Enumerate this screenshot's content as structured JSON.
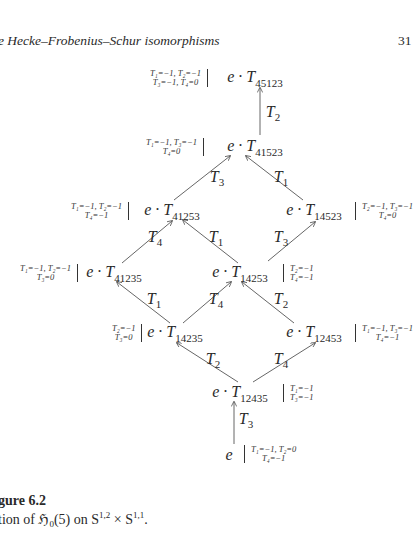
{
  "header": {
    "running_head": "e Hecke–Frobenius–Schur isomorphisms",
    "page_number": "31"
  },
  "diagram": {
    "nodes": [
      {
        "id": "T45123",
        "prefix": "e · ",
        "op": "T",
        "sub": "45123",
        "ann_side": "left",
        "ann_line1": "T₁=−1, T₂=−1",
        "ann_line2": "T₃=−1, T₄=0"
      },
      {
        "id": "T41523",
        "prefix": "e · ",
        "op": "T",
        "sub": "41523",
        "ann_side": "left",
        "ann_line1": "T₁=−1, T₃=−1",
        "ann_line2": "T₄=0"
      },
      {
        "id": "T41253",
        "prefix": "e · ",
        "op": "T",
        "sub": "41253",
        "ann_side": "left",
        "ann_line1": "T₁=−1, T₂=−1",
        "ann_line2": "T₄=−1"
      },
      {
        "id": "T14523",
        "prefix": "e · ",
        "op": "T",
        "sub": "14523",
        "ann_side": "right",
        "ann_line1": "T₂=−1, T₃=−1",
        "ann_line2": "T₄=0"
      },
      {
        "id": "T41235",
        "prefix": "e · ",
        "op": "T",
        "sub": "41235",
        "ann_side": "left",
        "ann_line1": "T₁=−1, T₂=−1",
        "ann_line2": "T₃=0"
      },
      {
        "id": "T14253",
        "prefix": "e · ",
        "op": "T",
        "sub": "14253",
        "ann_side": "right",
        "ann_line1": "T₂=−1",
        "ann_line2": "T₄=−1"
      },
      {
        "id": "T14235",
        "prefix": "e · ",
        "op": "T",
        "sub": "14235",
        "ann_side": "left",
        "ann_line1": "T₂=−1",
        "ann_line2": "T₃=0"
      },
      {
        "id": "T12453",
        "prefix": "e · ",
        "op": "T",
        "sub": "12453",
        "ann_side": "right",
        "ann_line1": "T₁=−1, T₃=−1",
        "ann_line2": "T₄=−1"
      },
      {
        "id": "T12435",
        "prefix": "e · ",
        "op": "T",
        "sub": "12435",
        "ann_side": "right",
        "ann_line1": "T₁=−1",
        "ann_line2": "T₃=−1"
      },
      {
        "id": "e",
        "prefix": "e",
        "op": "",
        "sub": "",
        "ann_side": "right",
        "ann_line1": "T₁=−1, T₂=0",
        "ann_line2": "T₄=−1"
      }
    ],
    "edges": [
      {
        "from": "T41523",
        "to": "T45123",
        "op": "T",
        "sub": "2"
      },
      {
        "from": "T41253",
        "to": "T41523",
        "op": "T",
        "sub": "3"
      },
      {
        "from": "T14523",
        "to": "T41523",
        "op": "T",
        "sub": "1"
      },
      {
        "from": "T41235",
        "to": "T41253",
        "op": "T",
        "sub": "4"
      },
      {
        "from": "T14253",
        "to": "T41253",
        "op": "T",
        "sub": "1"
      },
      {
        "from": "T14253",
        "to": "T14523",
        "op": "T",
        "sub": "3"
      },
      {
        "from": "T14235",
        "to": "T41235",
        "op": "T",
        "sub": "1"
      },
      {
        "from": "T14235",
        "to": "T14253",
        "op": "T",
        "sub": "4"
      },
      {
        "from": "T12453",
        "to": "T14253",
        "op": "T",
        "sub": "2"
      },
      {
        "from": "T12435",
        "to": "T14235",
        "op": "T",
        "sub": "2"
      },
      {
        "from": "T12435",
        "to": "T12453",
        "op": "T",
        "sub": "4"
      },
      {
        "from": "e",
        "to": "T12435",
        "op": "T",
        "sub": "3"
      }
    ]
  },
  "caption": {
    "title": "gure 6.2",
    "text_prefix": "tion of ℌ",
    "text_sub": "0",
    "text_mid": "(5) on S",
    "sup1": "1,2",
    "text_times": " × S",
    "sup2": "1,1",
    "text_end": "."
  }
}
